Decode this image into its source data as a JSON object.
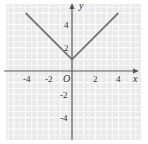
{
  "chart_data": {
    "type": "line",
    "title": "",
    "equation_depicted": "y = |x| + 1",
    "xlabel": "x",
    "ylabel": "y",
    "origin_label": "O",
    "xlim": [
      -6,
      6
    ],
    "ylim": [
      -6,
      6
    ],
    "x_ticks": [
      "-4",
      "-2",
      "2",
      "4"
    ],
    "y_ticks": [
      "4",
      "2",
      "-2",
      "-4"
    ],
    "grid": true,
    "series": [
      {
        "name": "y = |x| + 1",
        "x": [
          -4,
          0,
          4
        ],
        "y": [
          5,
          1,
          5
        ]
      }
    ]
  },
  "colors": {
    "background": "#eeeeee",
    "grid": "#ffffff",
    "axis": "#555555",
    "line": "#777777",
    "text": "#333333"
  }
}
